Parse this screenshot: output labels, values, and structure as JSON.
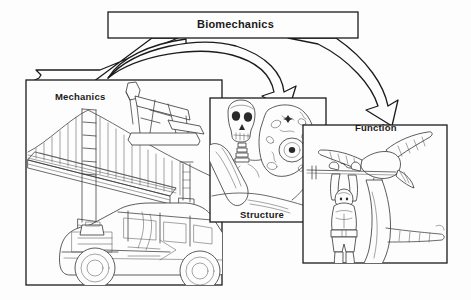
{
  "diagram": {
    "title": "Biomechanics",
    "type": "concept-diagram",
    "background_color": "#fdfdfd",
    "line_color": "#1b1b1b",
    "text_color": "#1b1b1b"
  },
  "boxes": {
    "biomechanics": {
      "label": "Biomechanics",
      "x": 108,
      "y": 12,
      "w": 250,
      "h": 26
    },
    "mechanics": {
      "label": "Mechanics",
      "x": 26,
      "y": 80,
      "w": 196,
      "h": 205,
      "illustrations": [
        "suspension-bridge",
        "oil-pumpjack",
        "automobile-cutaway"
      ]
    },
    "structure": {
      "label": "Structure",
      "x": 210,
      "y": 98,
      "w": 116,
      "h": 124,
      "illustrations": [
        "human-skull-skeleton",
        "biological-cell"
      ]
    },
    "function": {
      "label": "Function",
      "x": 303,
      "y": 125,
      "w": 144,
      "h": 138,
      "illustrations": [
        "weightlifter",
        "flying-eagle",
        "tree-branch"
      ]
    }
  },
  "arrows": [
    {
      "name": "biomechanics-to-mechanics",
      "from": "biomechanics",
      "to": "mechanics",
      "style": "ribbon-sweep-left"
    },
    {
      "name": "biomechanics-to-structure",
      "from": "biomechanics",
      "to": "structure",
      "style": "curved-ribbon-down"
    },
    {
      "name": "biomechanics-to-function",
      "from": "biomechanics",
      "to": "function",
      "style": "curved-ribbon-down-right"
    }
  ]
}
